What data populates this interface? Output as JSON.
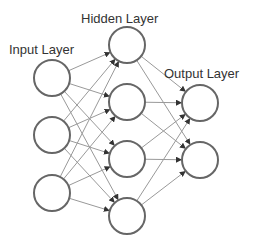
{
  "diagram": {
    "colors": {
      "node_stroke": "#666666",
      "edge": "#999999",
      "arrow": "#333333",
      "text": "#333333"
    },
    "labels": {
      "input": "Input Layer",
      "hidden": "Hidden Layer",
      "output": "Output Layer"
    },
    "label_positions": {
      "input": {
        "x": 9,
        "y": 54
      },
      "hidden": {
        "x": 81,
        "y": 23
      },
      "output": {
        "x": 164,
        "y": 78
      }
    },
    "node_radius": 18,
    "layers": [
      {
        "name": "input",
        "nodes": [
          {
            "x": 52,
            "y": 78
          },
          {
            "x": 52,
            "y": 135
          },
          {
            "x": 52,
            "y": 193
          }
        ]
      },
      {
        "name": "hidden",
        "nodes": [
          {
            "x": 127,
            "y": 45
          },
          {
            "x": 127,
            "y": 102
          },
          {
            "x": 127,
            "y": 159
          },
          {
            "x": 127,
            "y": 216
          }
        ]
      },
      {
        "name": "output",
        "nodes": [
          {
            "x": 200,
            "y": 103
          },
          {
            "x": 200,
            "y": 160
          }
        ]
      }
    ],
    "connections": "fully-connected between adjacent layers"
  }
}
